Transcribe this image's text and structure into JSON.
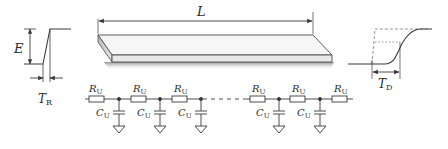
{
  "input_waveform": {
    "amplitude_label": "E",
    "rise_time_label": "T",
    "rise_time_subscript": "R"
  },
  "wire": {
    "length_label": "L"
  },
  "output_waveform": {
    "delay_label": "T",
    "delay_subscript": "D"
  },
  "rc_ladder": {
    "resistor_label": "R",
    "resistor_subscript": "U",
    "capacitor_label": "C",
    "capacitor_subscript": "U"
  },
  "colors": {
    "line": "#3a3a3a",
    "dashed": "#888888",
    "wire_fill": "#f4f4f4",
    "wire_shadow": "#9a9a9a"
  }
}
